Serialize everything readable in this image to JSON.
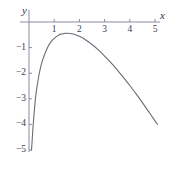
{
  "chart_data": {
    "type": "line",
    "title": "",
    "subtitle": "",
    "xlabel": "x",
    "ylabel": "y",
    "xlim": [
      -0.25,
      5.6
    ],
    "ylim": [
      -5.3,
      0.45
    ],
    "grid": false,
    "legend": null,
    "xticks": [
      1,
      2,
      3,
      4,
      5
    ],
    "xtick_labels": [
      "1",
      "2",
      "3",
      "4",
      "5"
    ],
    "yticks": [
      -1,
      -2,
      -3,
      -4,
      -5
    ],
    "ytick_labels": [
      "−1",
      "−2",
      "−3",
      "−4",
      "−5"
    ],
    "series": [
      {
        "name": "curve",
        "color": "#6b6b7a",
        "x": [
          0.1,
          0.13,
          0.16,
          0.2,
          0.25,
          0.3,
          0.4,
          0.5,
          0.6,
          0.75,
          0.9,
          1.0,
          1.1,
          1.2,
          1.3,
          1.4,
          1.5,
          1.75,
          2.0,
          2.25,
          2.5,
          2.75,
          3.0,
          3.25,
          3.5,
          3.75,
          4.0,
          4.25,
          4.5,
          4.75,
          5.0,
          5.1
        ],
        "y": [
          -5.0,
          -4.55,
          -4.1,
          -3.6,
          -3.05,
          -2.65,
          -2.05,
          -1.62,
          -1.32,
          -0.97,
          -0.74,
          -0.64,
          -0.56,
          -0.5,
          -0.47,
          -0.45,
          -0.44,
          -0.47,
          -0.56,
          -0.7,
          -0.88,
          -1.09,
          -1.33,
          -1.59,
          -1.87,
          -2.17,
          -2.48,
          -2.81,
          -3.15,
          -3.5,
          -3.86,
          -4.0
        ]
      }
    ],
    "axis_color": "#8a8aa0",
    "curve_color": "#6b6b7a",
    "background": "#ffffff"
  }
}
